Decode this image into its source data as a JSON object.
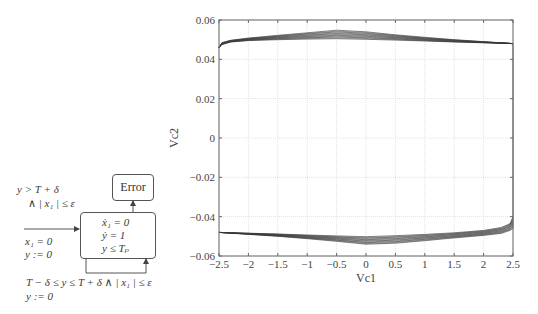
{
  "automaton": {
    "error_state": {
      "label": "Error"
    },
    "main_state": {
      "flow_lines": [
        "ẋ₁ = 0",
        "ẏ = 1",
        "y ≤ Tₚ"
      ]
    },
    "init_edge": {
      "reset_lines": [
        "x₁ = 0",
        "y := 0"
      ]
    },
    "error_edge": {
      "guard_lines": [
        "y > T + δ",
        "∧ | x₁ | ≤ ε"
      ]
    },
    "self_loop": {
      "guard_lines": [
        "T − δ ≤ y ≤ T + δ ∧  | x₁ | ≤ ε",
        "y := 0"
      ]
    }
  },
  "chart_data": {
    "type": "line",
    "title": "",
    "xlabel": "Vc1",
    "ylabel": "Vc2",
    "xlim": [
      -2.5,
      2.5
    ],
    "ylim": [
      -0.06,
      0.06
    ],
    "grid": true,
    "legend": null,
    "x_ticks": [
      "-2.5",
      "-2",
      "-1.5",
      "-1",
      "-0.5",
      "0",
      "0.5",
      "1",
      "1.5",
      "2",
      "2.5"
    ],
    "y_ticks": [
      "0.06",
      "0.04",
      "0.02",
      "0",
      "-0.02",
      "-0.04",
      "-0.06"
    ],
    "x_tick_labels": [
      "−2.5",
      "−2",
      "−1.5",
      "−1",
      "−0.5",
      "0",
      "0.5",
      "1",
      "1.5",
      "2",
      "2.5"
    ],
    "y_tick_labels": [
      "0.06",
      "0.04",
      "0.02",
      "0",
      "−0.02",
      "−0.04",
      "−0.06"
    ],
    "series": [
      {
        "name": "upper-band-top",
        "x": [
          -2.5,
          -2.45,
          -2.3,
          -2.0,
          -1.5,
          -1.0,
          -0.5,
          0.0,
          0.5,
          1.0,
          1.5,
          2.0,
          2.5
        ],
        "y": [
          0.046,
          0.0485,
          0.0497,
          0.0508,
          0.0522,
          0.0535,
          0.0548,
          0.054,
          0.0525,
          0.0512,
          0.05,
          0.049,
          0.048
        ]
      },
      {
        "name": "upper-band-bottom",
        "x": [
          -2.5,
          -2.45,
          -2.3,
          -2.0,
          -1.5,
          -1.0,
          -0.5,
          0.0,
          0.5,
          1.0,
          1.5,
          2.0,
          2.5
        ],
        "y": [
          0.046,
          0.0475,
          0.0488,
          0.0495,
          0.05,
          0.0503,
          0.0505,
          0.0502,
          0.0498,
          0.0493,
          0.0488,
          0.0484,
          0.048
        ]
      },
      {
        "name": "lower-band-top",
        "x": [
          -2.5,
          -2.0,
          -1.5,
          -1.0,
          -0.5,
          0.0,
          0.5,
          1.0,
          1.5,
          2.0,
          2.3,
          2.45,
          2.5
        ],
        "y": [
          -0.048,
          -0.0484,
          -0.0488,
          -0.0493,
          -0.0498,
          -0.0502,
          -0.0497,
          -0.049,
          -0.0482,
          -0.047,
          -0.0455,
          -0.0435,
          -0.04
        ]
      },
      {
        "name": "lower-band-bottom",
        "x": [
          -2.5,
          -2.0,
          -1.5,
          -1.0,
          -0.5,
          0.0,
          0.5,
          1.0,
          1.5,
          2.0,
          2.3,
          2.45,
          2.5
        ],
        "y": [
          -0.048,
          -0.049,
          -0.05,
          -0.0512,
          -0.0525,
          -0.054,
          -0.0535,
          -0.0522,
          -0.0508,
          -0.0495,
          -0.0485,
          -0.047,
          -0.046
        ]
      }
    ]
  }
}
